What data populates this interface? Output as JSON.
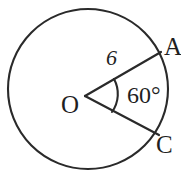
{
  "figure": {
    "type": "geometry-diagram",
    "background_color": "#ffffff",
    "stroke_color": "#2a2a2a",
    "text_color": "#1f1f1f"
  },
  "circle": {
    "name": "circle-O",
    "center_x": 88,
    "center_y": 89,
    "radius_px": 80,
    "stroke_width": 2
  },
  "labels": {
    "center_point": "O",
    "point_a": "A",
    "point_c": "C",
    "angle_measure": "60°",
    "radius_length": "6"
  },
  "segments": [
    {
      "name": "radius-OA",
      "from": "O",
      "to": "A",
      "length_label": "6",
      "x1": 85,
      "y1": 96,
      "x2": 161,
      "y2": 52
    },
    {
      "name": "radius-OC",
      "from": "O",
      "to": "C",
      "length_label": "",
      "x1": 85,
      "y1": 96,
      "x2": 159,
      "y2": 135
    }
  ],
  "angle_arc": {
    "name": "angle-arc-AOC",
    "measure": "60°",
    "vertex": "O"
  }
}
